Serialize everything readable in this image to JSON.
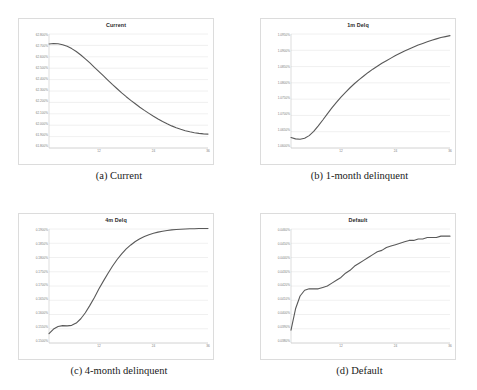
{
  "figure": {
    "layout": "2x2 grid of line charts",
    "background": "#ffffff",
    "curve_color": "#595959",
    "gridline_color": "#e4e4e4",
    "border_color": "#dcdcdc",
    "axis_label_color": "#7a7a7a"
  },
  "panels": [
    {
      "title": "Current",
      "caption": "(a) Current",
      "ylabels": [
        "62.800%",
        "62.700%",
        "62.600%",
        "62.500%",
        "62.400%",
        "62.300%",
        "62.200%",
        "62.100%",
        "62.000%",
        "61.900%",
        "61.800%"
      ],
      "xlabels": [
        "12",
        "24",
        "36"
      ]
    },
    {
      "title": "1m Delq",
      "caption": "(b) 1-month delinquent",
      "ylabels": [
        "1.0950%",
        "1.0900%",
        "1.0850%",
        "1.0800%",
        "1.0750%",
        "1.0700%",
        "1.0650%",
        "1.0600%"
      ],
      "xlabels": [
        "12",
        "24",
        "36"
      ]
    },
    {
      "title": "4m Delq",
      "caption": "(c) 4-month delinquent",
      "ylabels": [
        "0.1900%",
        "0.1850%",
        "0.1800%",
        "0.1750%",
        "0.1700%",
        "0.1650%",
        "0.1600%",
        "0.1550%",
        "0.1500%"
      ],
      "xlabels": [
        "12",
        "24",
        "36"
      ]
    },
    {
      "title": "Default",
      "caption": "(d) Default",
      "ylabels": [
        "0.0460%",
        "0.0450%",
        "0.0440%",
        "0.0430%",
        "0.0420%",
        "0.0410%",
        "0.0400%",
        "0.0390%",
        "0.0380%"
      ],
      "xlabels": [
        "12",
        "24",
        "36"
      ]
    }
  ],
  "chart_data": [
    {
      "type": "line",
      "title": "Current",
      "caption": "(a) Current",
      "xlabel": "",
      "ylabel": "",
      "grid": true,
      "legend": "none",
      "xlim": [
        1,
        36
      ],
      "ylim": [
        61.8,
        62.8
      ],
      "xticks": [
        12,
        24,
        36
      ],
      "yticks": [
        61.8,
        61.9,
        62.0,
        62.1,
        62.2,
        62.3,
        62.4,
        62.5,
        62.6,
        62.7,
        62.8
      ],
      "x": [
        1,
        2,
        3,
        4,
        5,
        6,
        7,
        8,
        9,
        10,
        11,
        12,
        13,
        14,
        15,
        16,
        17,
        18,
        19,
        20,
        21,
        22,
        23,
        24,
        25,
        26,
        27,
        28,
        29,
        30,
        31,
        32,
        33,
        34,
        35,
        36
      ],
      "y": [
        62.712,
        62.716,
        62.714,
        62.706,
        62.692,
        62.672,
        62.646,
        62.616,
        62.582,
        62.546,
        62.508,
        62.47,
        62.432,
        62.394,
        62.356,
        62.32,
        62.284,
        62.25,
        62.218,
        62.188,
        62.158,
        62.13,
        62.104,
        62.078,
        62.054,
        62.032,
        62.012,
        61.994,
        61.978,
        61.964,
        61.952,
        61.942,
        61.934,
        61.928,
        61.924,
        61.922
      ]
    },
    {
      "type": "line",
      "title": "1m Delq",
      "caption": "(b) 1-month delinquent",
      "xlabel": "",
      "ylabel": "",
      "grid": true,
      "legend": "none",
      "xlim": [
        1,
        36
      ],
      "ylim": [
        1.06,
        1.095
      ],
      "xticks": [
        12,
        24,
        36
      ],
      "yticks": [
        1.06,
        1.065,
        1.07,
        1.075,
        1.08,
        1.085,
        1.09,
        1.095
      ],
      "x": [
        1,
        2,
        3,
        4,
        5,
        6,
        7,
        8,
        9,
        10,
        11,
        12,
        13,
        14,
        15,
        16,
        17,
        18,
        19,
        20,
        21,
        22,
        23,
        24,
        25,
        26,
        27,
        28,
        29,
        30,
        31,
        32,
        33,
        34,
        35,
        36
      ],
      "y": [
        1.0632,
        1.0628,
        1.0627,
        1.063,
        1.0638,
        1.0651,
        1.0668,
        1.0686,
        1.0705,
        1.0723,
        1.074,
        1.0756,
        1.0771,
        1.0785,
        1.0798,
        1.081,
        1.0821,
        1.0832,
        1.0842,
        1.0851,
        1.086,
        1.0868,
        1.0876,
        1.0884,
        1.0891,
        1.0898,
        1.0904,
        1.091,
        1.0916,
        1.0921,
        1.0926,
        1.0931,
        1.0935,
        1.0939,
        1.0942,
        1.0945
      ]
    },
    {
      "type": "line",
      "title": "4m Delq",
      "caption": "(c) 4-month delinquent",
      "xlabel": "",
      "ylabel": "",
      "grid": true,
      "legend": "none",
      "xlim": [
        1,
        36
      ],
      "ylim": [
        0.15,
        0.19
      ],
      "xticks": [
        12,
        24,
        36
      ],
      "yticks": [
        0.15,
        0.155,
        0.16,
        0.165,
        0.17,
        0.175,
        0.18,
        0.185,
        0.19
      ],
      "x": [
        1,
        2,
        3,
        4,
        5,
        6,
        7,
        8,
        9,
        10,
        11,
        12,
        13,
        14,
        15,
        16,
        17,
        18,
        19,
        20,
        21,
        22,
        23,
        24,
        25,
        26,
        27,
        28,
        29,
        30,
        31,
        32,
        33,
        34,
        35,
        36
      ],
      "y": [
        0.1533,
        0.1549,
        0.1558,
        0.1561,
        0.156,
        0.1562,
        0.157,
        0.1585,
        0.1606,
        0.1632,
        0.166,
        0.169,
        0.1718,
        0.1745,
        0.177,
        0.1793,
        0.1813,
        0.183,
        0.1844,
        0.1856,
        0.1866,
        0.1874,
        0.188,
        0.1885,
        0.1889,
        0.1892,
        0.1895,
        0.1897,
        0.1898,
        0.1899,
        0.19,
        0.1901,
        0.1901,
        0.1902,
        0.1902,
        0.1902
      ]
    },
    {
      "type": "line",
      "title": "Default",
      "caption": "(d) Default",
      "xlabel": "",
      "ylabel": "",
      "grid": true,
      "legend": "none",
      "xlim": [
        1,
        36
      ],
      "ylim": [
        0.038,
        0.046
      ],
      "xticks": [
        12,
        24,
        36
      ],
      "yticks": [
        0.038,
        0.039,
        0.04,
        0.041,
        0.042,
        0.043,
        0.044,
        0.045,
        0.046
      ],
      "x": [
        1,
        2,
        3,
        4,
        5,
        6,
        7,
        8,
        9,
        10,
        11,
        12,
        13,
        14,
        15,
        16,
        17,
        18,
        19,
        20,
        21,
        22,
        23,
        24,
        25,
        26,
        27,
        28,
        29,
        30,
        31,
        32,
        33,
        34,
        35,
        36
      ],
      "y": [
        0.0389,
        0.0404,
        0.0413,
        0.0417,
        0.0418,
        0.0418,
        0.0418,
        0.0419,
        0.042,
        0.0422,
        0.0424,
        0.0426,
        0.0429,
        0.0431,
        0.0434,
        0.0436,
        0.0438,
        0.044,
        0.0442,
        0.0444,
        0.0445,
        0.0447,
        0.0448,
        0.0449,
        0.045,
        0.0451,
        0.0452,
        0.0452,
        0.0453,
        0.0453,
        0.0454,
        0.0454,
        0.0454,
        0.0455,
        0.0455,
        0.0455
      ]
    }
  ]
}
